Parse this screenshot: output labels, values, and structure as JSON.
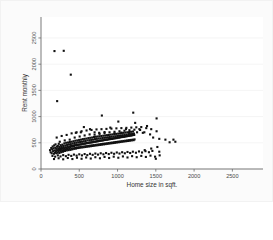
{
  "figure": {
    "background_color": "#fbfbfb",
    "plot_background_color": "#ffffff",
    "marker_color": "#111111",
    "axis_color": "#6b6b6b",
    "grid_color": "#f0f0f0"
  },
  "chart_data": {
    "type": "scatter",
    "title": "",
    "subtitle": "",
    "xlabel": "Home size in sqft.",
    "ylabel": "Rent monthly",
    "xlim": [
      0,
      2900
    ],
    "ylim": [
      0,
      2900
    ],
    "xticks": [
      0,
      500,
      1000,
      1500,
      2000,
      2500
    ],
    "xtick_labels": [
      "0",
      "500",
      "1000",
      "1500",
      "2000",
      "2500"
    ],
    "yticks": [
      0,
      500,
      1000,
      1500,
      2000,
      2500
    ],
    "ytick_labels": [
      "0",
      "500",
      "1000",
      "1500",
      "2000",
      "2500"
    ],
    "grid": "horizontal-faint",
    "legend": "none",
    "legend_position": "none",
    "marker_shape": "square",
    "marker_size_px": 2.1,
    "annotations": [],
    "n_points": 404,
    "points": [
      [
        176,
        2250
      ],
      [
        297,
        2255
      ],
      [
        389,
        1800
      ],
      [
        211,
        1295
      ],
      [
        795,
        1020
      ],
      [
        1205,
        1075
      ],
      [
        1510,
        965
      ],
      [
        1010,
        905
      ],
      [
        1230,
        880
      ],
      [
        1385,
        820
      ],
      [
        1510,
        720
      ],
      [
        560,
        800
      ],
      [
        640,
        760
      ],
      [
        905,
        790
      ],
      [
        1110,
        760
      ],
      [
        1295,
        745
      ],
      [
        455,
        690
      ],
      [
        520,
        700
      ],
      [
        700,
        700
      ],
      [
        760,
        690
      ],
      [
        830,
        705
      ],
      [
        960,
        680
      ],
      [
        1050,
        695
      ],
      [
        1150,
        690
      ],
      [
        1255,
        700
      ],
      [
        1330,
        690
      ],
      [
        1425,
        660
      ],
      [
        1465,
        600
      ],
      [
        1545,
        575
      ],
      [
        1625,
        560
      ],
      [
        1730,
        560
      ],
      [
        118,
        360
      ],
      [
        126,
        320
      ],
      [
        134,
        400
      ],
      [
        140,
        300
      ],
      [
        146,
        375
      ],
      [
        152,
        430
      ],
      [
        158,
        340
      ],
      [
        163,
        395
      ],
      [
        168,
        290
      ],
      [
        172,
        450
      ],
      [
        178,
        355
      ],
      [
        182,
        310
      ],
      [
        186,
        405
      ],
      [
        190,
        470
      ],
      [
        195,
        340
      ],
      [
        199,
        385
      ],
      [
        203,
        300
      ],
      [
        208,
        425
      ],
      [
        212,
        360
      ],
      [
        216,
        315
      ],
      [
        220,
        440
      ],
      [
        224,
        395
      ],
      [
        228,
        340
      ],
      [
        232,
        480
      ],
      [
        236,
        365
      ],
      [
        240,
        305
      ],
      [
        244,
        420
      ],
      [
        248,
        390
      ],
      [
        252,
        345
      ],
      [
        256,
        455
      ],
      [
        260,
        375
      ],
      [
        264,
        320
      ],
      [
        268,
        430
      ],
      [
        272,
        400
      ],
      [
        276,
        350
      ],
      [
        280,
        465
      ],
      [
        284,
        385
      ],
      [
        288,
        330
      ],
      [
        292,
        440
      ],
      [
        296,
        405
      ],
      [
        300,
        360
      ],
      [
        305,
        490
      ],
      [
        309,
        395
      ],
      [
        313,
        345
      ],
      [
        317,
        450
      ],
      [
        321,
        415
      ],
      [
        325,
        370
      ],
      [
        329,
        500
      ],
      [
        333,
        400
      ],
      [
        337,
        355
      ],
      [
        341,
        460
      ],
      [
        345,
        425
      ],
      [
        349,
        380
      ],
      [
        353,
        505
      ],
      [
        357,
        410
      ],
      [
        361,
        360
      ],
      [
        365,
        470
      ],
      [
        369,
        430
      ],
      [
        373,
        385
      ],
      [
        377,
        515
      ],
      [
        381,
        420
      ],
      [
        385,
        365
      ],
      [
        389,
        475
      ],
      [
        393,
        440
      ],
      [
        397,
        390
      ],
      [
        401,
        520
      ],
      [
        405,
        430
      ],
      [
        409,
        375
      ],
      [
        414,
        485
      ],
      [
        418,
        445
      ],
      [
        422,
        395
      ],
      [
        426,
        530
      ],
      [
        430,
        440
      ],
      [
        434,
        385
      ],
      [
        438,
        495
      ],
      [
        442,
        455
      ],
      [
        446,
        400
      ],
      [
        450,
        540
      ],
      [
        454,
        450
      ],
      [
        458,
        390
      ],
      [
        462,
        500
      ],
      [
        466,
        460
      ],
      [
        470,
        410
      ],
      [
        474,
        545
      ],
      [
        478,
        455
      ],
      [
        482,
        400
      ],
      [
        486,
        510
      ],
      [
        490,
        465
      ],
      [
        494,
        415
      ],
      [
        498,
        555
      ],
      [
        502,
        465
      ],
      [
        506,
        405
      ],
      [
        511,
        515
      ],
      [
        515,
        470
      ],
      [
        519,
        420
      ],
      [
        523,
        560
      ],
      [
        527,
        470
      ],
      [
        531,
        410
      ],
      [
        535,
        520
      ],
      [
        539,
        480
      ],
      [
        543,
        425
      ],
      [
        547,
        570
      ],
      [
        551,
        480
      ],
      [
        555,
        415
      ],
      [
        559,
        530
      ],
      [
        563,
        485
      ],
      [
        567,
        430
      ],
      [
        571,
        575
      ],
      [
        575,
        485
      ],
      [
        579,
        420
      ],
      [
        583,
        535
      ],
      [
        587,
        490
      ],
      [
        591,
        435
      ],
      [
        595,
        580
      ],
      [
        599,
        495
      ],
      [
        603,
        425
      ],
      [
        608,
        545
      ],
      [
        612,
        495
      ],
      [
        616,
        440
      ],
      [
        620,
        590
      ],
      [
        624,
        500
      ],
      [
        628,
        430
      ],
      [
        632,
        550
      ],
      [
        636,
        505
      ],
      [
        640,
        445
      ],
      [
        644,
        595
      ],
      [
        648,
        505
      ],
      [
        652,
        435
      ],
      [
        656,
        555
      ],
      [
        660,
        510
      ],
      [
        664,
        450
      ],
      [
        668,
        600
      ],
      [
        672,
        510
      ],
      [
        676,
        440
      ],
      [
        680,
        560
      ],
      [
        684,
        515
      ],
      [
        688,
        455
      ],
      [
        692,
        610
      ],
      [
        696,
        520
      ],
      [
        700,
        445
      ],
      [
        705,
        570
      ],
      [
        709,
        520
      ],
      [
        713,
        460
      ],
      [
        717,
        615
      ],
      [
        721,
        525
      ],
      [
        725,
        450
      ],
      [
        729,
        575
      ],
      [
        733,
        530
      ],
      [
        737,
        465
      ],
      [
        741,
        620
      ],
      [
        745,
        530
      ],
      [
        749,
        455
      ],
      [
        753,
        580
      ],
      [
        757,
        535
      ],
      [
        761,
        470
      ],
      [
        765,
        625
      ],
      [
        769,
        540
      ],
      [
        773,
        460
      ],
      [
        777,
        585
      ],
      [
        781,
        540
      ],
      [
        785,
        475
      ],
      [
        789,
        630
      ],
      [
        793,
        545
      ],
      [
        797,
        465
      ],
      [
        802,
        590
      ],
      [
        806,
        545
      ],
      [
        810,
        480
      ],
      [
        814,
        635
      ],
      [
        818,
        550
      ],
      [
        822,
        470
      ],
      [
        826,
        595
      ],
      [
        830,
        555
      ],
      [
        834,
        485
      ],
      [
        838,
        640
      ],
      [
        842,
        555
      ],
      [
        846,
        475
      ],
      [
        850,
        600
      ],
      [
        854,
        560
      ],
      [
        858,
        490
      ],
      [
        862,
        645
      ],
      [
        866,
        560
      ],
      [
        870,
        480
      ],
      [
        874,
        605
      ],
      [
        878,
        565
      ],
      [
        882,
        495
      ],
      [
        886,
        650
      ],
      [
        890,
        570
      ],
      [
        894,
        485
      ],
      [
        899,
        610
      ],
      [
        903,
        570
      ],
      [
        907,
        500
      ],
      [
        911,
        655
      ],
      [
        915,
        575
      ],
      [
        919,
        490
      ],
      [
        923,
        615
      ],
      [
        927,
        575
      ],
      [
        931,
        505
      ],
      [
        935,
        660
      ],
      [
        939,
        580
      ],
      [
        943,
        495
      ],
      [
        947,
        620
      ],
      [
        951,
        585
      ],
      [
        955,
        510
      ],
      [
        959,
        665
      ],
      [
        963,
        585
      ],
      [
        967,
        500
      ],
      [
        971,
        625
      ],
      [
        975,
        590
      ],
      [
        979,
        515
      ],
      [
        983,
        670
      ],
      [
        987,
        590
      ],
      [
        991,
        505
      ],
      [
        996,
        630
      ],
      [
        1000,
        595
      ],
      [
        1004,
        520
      ],
      [
        1008,
        675
      ],
      [
        1012,
        600
      ],
      [
        1016,
        510
      ],
      [
        1020,
        635
      ],
      [
        1024,
        600
      ],
      [
        1028,
        525
      ],
      [
        1032,
        680
      ],
      [
        1036,
        605
      ],
      [
        1040,
        515
      ],
      [
        1044,
        640
      ],
      [
        1048,
        610
      ],
      [
        1052,
        530
      ],
      [
        1056,
        685
      ],
      [
        1060,
        610
      ],
      [
        1064,
        520
      ],
      [
        1068,
        645
      ],
      [
        1072,
        615
      ],
      [
        1076,
        535
      ],
      [
        1080,
        690
      ],
      [
        1084,
        615
      ],
      [
        1088,
        525
      ],
      [
        1093,
        650
      ],
      [
        1097,
        620
      ],
      [
        1101,
        540
      ],
      [
        1105,
        695
      ],
      [
        1109,
        625
      ],
      [
        1113,
        530
      ],
      [
        1117,
        655
      ],
      [
        1121,
        625
      ],
      [
        1125,
        545
      ],
      [
        1129,
        700
      ],
      [
        1133,
        630
      ],
      [
        1137,
        535
      ],
      [
        1141,
        660
      ],
      [
        1145,
        630
      ],
      [
        1149,
        550
      ],
      [
        1153,
        705
      ],
      [
        1157,
        635
      ],
      [
        1161,
        540
      ],
      [
        1165,
        665
      ],
      [
        1169,
        640
      ],
      [
        1173,
        555
      ],
      [
        1177,
        710
      ],
      [
        1181,
        640
      ],
      [
        1185,
        545
      ],
      [
        1190,
        670
      ],
      [
        1194,
        645
      ],
      [
        1198,
        560
      ],
      [
        1202,
        715
      ],
      [
        1206,
        650
      ],
      [
        1210,
        550
      ],
      [
        1214,
        675
      ],
      [
        1218,
        650
      ],
      [
        1222,
        565
      ],
      [
        150,
        250
      ],
      [
        185,
        235
      ],
      [
        220,
        260
      ],
      [
        255,
        240
      ],
      [
        290,
        265
      ],
      [
        325,
        245
      ],
      [
        360,
        270
      ],
      [
        395,
        250
      ],
      [
        430,
        275
      ],
      [
        465,
        255
      ],
      [
        500,
        280
      ],
      [
        535,
        260
      ],
      [
        570,
        285
      ],
      [
        605,
        265
      ],
      [
        640,
        290
      ],
      [
        675,
        270
      ],
      [
        710,
        295
      ],
      [
        745,
        275
      ],
      [
        780,
        300
      ],
      [
        815,
        280
      ],
      [
        850,
        305
      ],
      [
        885,
        285
      ],
      [
        920,
        310
      ],
      [
        955,
        290
      ],
      [
        990,
        315
      ],
      [
        1025,
        295
      ],
      [
        1060,
        320
      ],
      [
        1095,
        300
      ],
      [
        1130,
        325
      ],
      [
        1165,
        305
      ],
      [
        1200,
        330
      ],
      [
        1240,
        310
      ],
      [
        1280,
        335
      ],
      [
        1320,
        315
      ],
      [
        1365,
        340
      ],
      [
        1410,
        320
      ],
      [
        1455,
        345
      ],
      [
        1500,
        195
      ],
      [
        1545,
        330
      ],
      [
        170,
        190
      ],
      [
        230,
        205
      ],
      [
        290,
        185
      ],
      [
        350,
        210
      ],
      [
        410,
        190
      ],
      [
        470,
        215
      ],
      [
        530,
        195
      ],
      [
        590,
        220
      ],
      [
        650,
        200
      ],
      [
        710,
        225
      ],
      [
        770,
        205
      ],
      [
        830,
        230
      ],
      [
        890,
        210
      ],
      [
        950,
        235
      ],
      [
        1010,
        215
      ],
      [
        1070,
        240
      ],
      [
        1130,
        220
      ],
      [
        1190,
        245
      ],
      [
        1250,
        225
      ],
      [
        1310,
        250
      ],
      [
        1370,
        230
      ],
      [
        1430,
        255
      ],
      [
        1490,
        235
      ],
      [
        1550,
        260
      ],
      [
        245,
        520
      ],
      [
        310,
        545
      ],
      [
        375,
        560
      ],
      [
        440,
        600
      ],
      [
        505,
        620
      ],
      [
        570,
        640
      ],
      [
        635,
        660
      ],
      [
        700,
        655
      ],
      [
        765,
        670
      ],
      [
        830,
        685
      ],
      [
        895,
        700
      ],
      [
        960,
        710
      ],
      [
        1025,
        720
      ],
      [
        1090,
        730
      ],
      [
        1155,
        740
      ],
      [
        1220,
        750
      ],
      [
        1285,
        760
      ],
      [
        1350,
        700
      ],
      [
        205,
        600
      ],
      [
        270,
        630
      ],
      [
        335,
        650
      ],
      [
        400,
        680
      ],
      [
        465,
        700
      ],
      [
        530,
        720
      ],
      [
        595,
        735
      ],
      [
        660,
        745
      ],
      [
        725,
        755
      ],
      [
        790,
        760
      ],
      [
        855,
        765
      ],
      [
        920,
        770
      ],
      [
        985,
        775
      ],
      [
        1050,
        780
      ],
      [
        1115,
        785
      ],
      [
        1180,
        790
      ],
      [
        1245,
        795
      ],
      [
        1310,
        800
      ],
      [
        1375,
        780
      ],
      [
        1440,
        760
      ],
      [
        1520,
        420
      ],
      [
        1440,
        390
      ],
      [
        1355,
        360
      ],
      [
        1680,
        510
      ],
      [
        1755,
        520
      ]
    ]
  }
}
